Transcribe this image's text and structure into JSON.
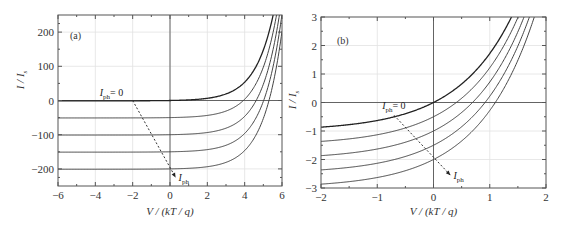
{
  "chart_data": [
    {
      "type": "line",
      "panel_label": "(a)",
      "xlabel": "V / (kT / q)",
      "ylabel": "I / I_s",
      "xlim": [
        -6,
        6
      ],
      "ylim": [
        -250,
        250
      ],
      "xticks": [
        -6,
        -4,
        -2,
        0,
        2,
        4,
        6
      ],
      "yticks": [
        -200,
        -100,
        0,
        100,
        200
      ],
      "xtick_labels": [
        "−6",
        "−4",
        "−2",
        "0",
        "2",
        "4",
        "6"
      ],
      "ytick_labels": [
        "−200",
        "−100",
        "0",
        "100",
        "200"
      ],
      "grid": true,
      "function": "I/Is = exp(V) - 1 - Iph",
      "series": [
        {
          "name": "Iph = 0",
          "Iph": 0
        },
        {
          "name": "Iph = 50",
          "Iph": 50
        },
        {
          "name": "Iph = 100",
          "Iph": 100
        },
        {
          "name": "Iph = 150",
          "Iph": 150
        },
        {
          "name": "Iph = 200",
          "Iph": 200
        }
      ],
      "annotations": [
        {
          "text_main": "I",
          "text_sub": "ph",
          "text_rest": "= 0",
          "x": -2,
          "y": 0
        },
        {
          "text_main": "I",
          "text_sub": "ph",
          "text_rest": "",
          "x": 0.3,
          "y": -210,
          "arrow": {
            "from": [
              -2,
              0
            ],
            "to": [
              0.3,
              -225
            ]
          }
        }
      ]
    },
    {
      "type": "line",
      "panel_label": "(b)",
      "xlabel": "V / (kT / q)",
      "ylabel": "I / I_s",
      "xlim": [
        -2,
        2
      ],
      "ylim": [
        -3,
        3
      ],
      "xticks": [
        -2,
        -1,
        0,
        1,
        2
      ],
      "yticks": [
        -3,
        -2,
        -1,
        0,
        1,
        2,
        3
      ],
      "xtick_labels": [
        "−2",
        "−1",
        "0",
        "1",
        "2"
      ],
      "ytick_labels": [
        "−3",
        "−2",
        "−1",
        "0",
        "1",
        "2",
        "3"
      ],
      "grid": true,
      "function": "I/Is = exp(V) - 1 - Iph",
      "series": [
        {
          "name": "Iph = 0",
          "Iph": 0
        },
        {
          "name": "Iph = 0.5",
          "Iph": 0.5
        },
        {
          "name": "Iph = 1",
          "Iph": 1
        },
        {
          "name": "Iph = 1.5",
          "Iph": 1.5
        },
        {
          "name": "Iph = 2",
          "Iph": 2
        }
      ],
      "annotations": [
        {
          "text_main": "I",
          "text_sub": "ph",
          "text_rest": "= 0",
          "x": -0.7,
          "y": -0.3
        },
        {
          "text_main": "I",
          "text_sub": "ph",
          "text_rest": "",
          "x": 0.4,
          "y": -2.6,
          "arrow": {
            "from": [
              -0.7,
              -0.45
            ],
            "to": [
              0.3,
              -2.55
            ]
          }
        }
      ]
    }
  ]
}
